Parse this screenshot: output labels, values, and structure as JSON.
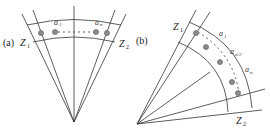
{
  "figure": {
    "panel_a": {
      "tag": "(a)",
      "zone_left": "Z",
      "zone_left_sub": "1",
      "zone_right": "Z",
      "zone_right_sub": "2",
      "first_label": "a",
      "first_label_sub": "1",
      "last_label": "a",
      "last_label_sub": "n"
    },
    "panel_b": {
      "tag": "(b)",
      "zone_top": "Z",
      "zone_top_sub": "1",
      "zone_bottom": "Z",
      "zone_bottom_sub": "2",
      "label_first": "a",
      "label_first_sub": "1",
      "label_mid": "a",
      "label_mid_sub": "n/2",
      "label_last": "a",
      "label_last_sub": "n"
    },
    "colors": {
      "line": "#333333",
      "dot_fill": "#8a8a8a",
      "dot_stroke": "#555555"
    }
  }
}
